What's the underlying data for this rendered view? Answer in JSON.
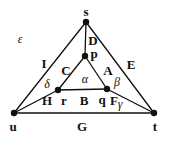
{
  "figure": {
    "width": 169,
    "height": 143,
    "background": "#ffffff",
    "ink_color": "#111111",
    "node_radius": 3.2,
    "edge_width": 1.3
  },
  "chart_data": {
    "type": "diagram",
    "title": "",
    "nodes": [
      {
        "id": "s",
        "label": "s",
        "x": 86,
        "y": 22,
        "label_dx": 0,
        "label_dy": -11
      },
      {
        "id": "p",
        "label": "p",
        "x": 85,
        "y": 56,
        "label_dx": 9,
        "label_dy": -3
      },
      {
        "id": "r",
        "label": "r",
        "x": 58,
        "y": 90,
        "label_dx": 6,
        "label_dy": 10
      },
      {
        "id": "q",
        "label": "q",
        "x": 107,
        "y": 89,
        "label_dx": -5,
        "label_dy": 10
      },
      {
        "id": "u",
        "label": "u",
        "x": 14,
        "y": 113,
        "label_dx": -1,
        "label_dy": 13
      },
      {
        "id": "t",
        "label": "t",
        "x": 154,
        "y": 113,
        "label_dx": 1,
        "label_dy": 13
      }
    ],
    "edges": [
      {
        "id": "D",
        "from": "s",
        "to": "p",
        "label": "D",
        "label_x": 93,
        "label_y": 40
      },
      {
        "id": "I",
        "from": "s",
        "to": "u",
        "label": "I",
        "label_x": 44,
        "label_y": 63
      },
      {
        "id": "E",
        "from": "s",
        "to": "t",
        "label": "E",
        "label_x": 131,
        "label_y": 64
      },
      {
        "id": "C",
        "from": "p",
        "to": "r",
        "label": "C",
        "label_x": 66,
        "label_y": 70
      },
      {
        "id": "A",
        "from": "p",
        "to": "q",
        "label": "A",
        "label_x": 108,
        "label_y": 70
      },
      {
        "id": "B",
        "from": "r",
        "to": "q",
        "label": "B",
        "label_x": 84,
        "label_y": 100
      },
      {
        "id": "H",
        "from": "r",
        "to": "u",
        "label": "H",
        "label_x": 47,
        "label_y": 100
      },
      {
        "id": "F",
        "from": "q",
        "to": "t",
        "label": "F",
        "label_x": 114,
        "label_y": 100
      },
      {
        "id": "G",
        "from": "u",
        "to": "t",
        "label": "G",
        "label_x": 82,
        "label_y": 126
      }
    ],
    "angle_labels": [
      {
        "id": "alpha",
        "label": "α",
        "x": 85,
        "y": 79,
        "at_node": "p"
      },
      {
        "id": "beta",
        "label": "β",
        "x": 117,
        "y": 82,
        "at_node": "q"
      },
      {
        "id": "gamma",
        "label": "γ",
        "x": 120,
        "y": 104,
        "at_node": "q"
      },
      {
        "id": "delta",
        "label": "δ",
        "x": 47,
        "y": 84,
        "at_node": "r"
      },
      {
        "id": "epsilon",
        "label": "ε",
        "x": 20,
        "y": 39,
        "at_node": "u"
      }
    ]
  }
}
